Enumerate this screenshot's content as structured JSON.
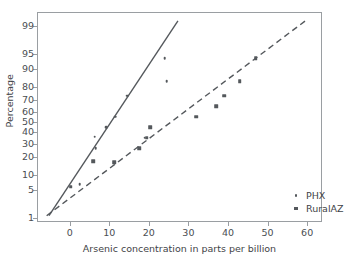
{
  "chart_data": {
    "type": "scatter",
    "title": "",
    "xlabel": "Arsenic concentration in parts per billion",
    "ylabel": "Percentage",
    "xlim": [
      -8,
      64
    ],
    "xticks": [
      0,
      10,
      20,
      30,
      40,
      50,
      60
    ],
    "xticklabels": [
      "0",
      "10",
      "20",
      "30",
      "40",
      "50",
      "60"
    ],
    "yscale": "probability",
    "ylim": [
      0.7,
      99.6
    ],
    "yticks": [
      1,
      5,
      10,
      20,
      30,
      40,
      50,
      60,
      70,
      80,
      90,
      95,
      99
    ],
    "yticklabels": [
      "1",
      "5",
      "10",
      "20",
      "30",
      "40",
      "50",
      "60",
      "70",
      "80",
      "90",
      "95",
      "99"
    ],
    "grid": false,
    "legend_position": "lower right",
    "marker_color": "#54585c",
    "line_color": "#54585c",
    "frame_color": "#9a9ea2",
    "series": [
      {
        "name": "PHX",
        "marker": "circle",
        "linestyle": "solid",
        "points": [
          {
            "x": 0.3,
            "y": 5.8
          },
          {
            "x": 2.5,
            "y": 6.5
          },
          {
            "x": 6.3,
            "y": 36.0
          },
          {
            "x": 6.6,
            "y": 26.0
          },
          {
            "x": 9.3,
            "y": 45.0
          },
          {
            "x": 11.5,
            "y": 55.0
          },
          {
            "x": 14.5,
            "y": 74.0
          },
          {
            "x": 19.0,
            "y": 35.0
          },
          {
            "x": 24.0,
            "y": 94.0
          },
          {
            "x": 24.5,
            "y": 84.0
          }
        ],
        "fit_line": [
          {
            "x": -5.2,
            "y": 1.0
          },
          {
            "x": 27.6,
            "y": 99.3
          }
        ]
      },
      {
        "name": "RuralAZ",
        "marker": "square",
        "linestyle": "dashed",
        "points": [
          {
            "x": 0.3,
            "y": 5.8
          },
          {
            "x": 6.0,
            "y": 17.0
          },
          {
            "x": 11.3,
            "y": 16.5
          },
          {
            "x": 17.5,
            "y": 26.0
          },
          {
            "x": 19.5,
            "y": 35.0
          },
          {
            "x": 20.3,
            "y": 45.0
          },
          {
            "x": 32.0,
            "y": 55.0
          },
          {
            "x": 37.0,
            "y": 65.0
          },
          {
            "x": 39.0,
            "y": 74.0
          },
          {
            "x": 43.0,
            "y": 84.0
          },
          {
            "x": 47.0,
            "y": 94.0
          }
        ],
        "fit_line": [
          {
            "x": -5.8,
            "y": 1.0
          },
          {
            "x": 60.0,
            "y": 99.3
          }
        ]
      }
    ]
  },
  "legend": {
    "items": [
      {
        "label": "PHX",
        "marker": "circle"
      },
      {
        "label": "RuralAZ",
        "marker": "square"
      }
    ]
  }
}
